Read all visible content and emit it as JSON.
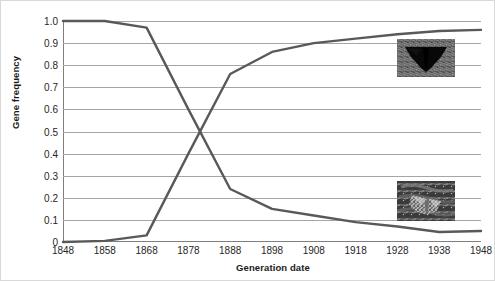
{
  "chart_data": {
    "type": "line",
    "title": "",
    "xlabel": "Generation date",
    "ylabel": "Gene frequency",
    "x": [
      1848,
      1858,
      1868,
      1878,
      1888,
      1898,
      1908,
      1918,
      1928,
      1938,
      1948
    ],
    "categories": [
      "1848",
      "1858",
      "1868",
      "1878",
      "1888",
      "1898",
      "1908",
      "1918",
      "1928",
      "1938",
      "1948"
    ],
    "xlim": [
      1848,
      1948
    ],
    "ylim": [
      0,
      1.0
    ],
    "ytick_labels": [
      "1.0",
      "0.9",
      "0.8",
      "0.7",
      "0.6",
      "0.5",
      "0.4",
      "0.3",
      "0.2",
      "0.1",
      "0"
    ],
    "ytick_values": [
      1.0,
      0.9,
      0.8,
      0.7,
      0.6,
      0.5,
      0.4,
      0.3,
      0.2,
      0.1,
      0
    ],
    "grid": "horizontal",
    "legend": "none",
    "line_color": "#595959",
    "gridline_color": "#a6a6a6",
    "axis_color": "#7f7f7f",
    "series": [
      {
        "name": "light-morph-declining",
        "values": [
          1.0,
          1.0,
          0.97,
          0.6,
          0.24,
          0.15,
          0.12,
          0.09,
          0.07,
          0.045,
          0.05
        ]
      },
      {
        "name": "dark-morph-rising",
        "values": [
          0.0,
          0.005,
          0.03,
          0.4,
          0.76,
          0.86,
          0.9,
          0.92,
          0.94,
          0.955,
          0.96
        ]
      }
    ],
    "crossing_point": {
      "x": 1880,
      "y": 0.5
    },
    "annotations": [
      {
        "name": "dark-moth-photo",
        "description": "melanic dark peppered moth on soot-darkened bark",
        "x": 1938,
        "y": 0.87
      },
      {
        "name": "light-moth-photo",
        "description": "pale speckled peppered moth camouflaged on lichen-covered bark",
        "x": 1938,
        "y": 0.18
      }
    ]
  }
}
